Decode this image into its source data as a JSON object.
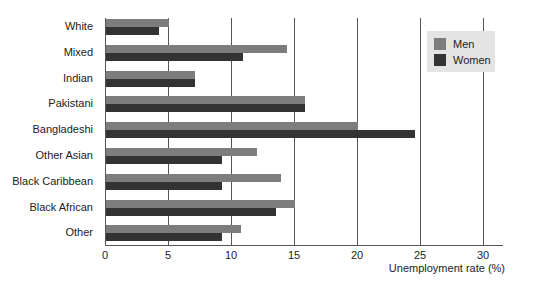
{
  "chart_data": {
    "type": "bar",
    "orientation": "horizontal",
    "title": "",
    "xlabel": "Unemployment rate (%)",
    "ylabel": "",
    "xlim": [
      0,
      30
    ],
    "xticks": [
      0,
      5,
      10,
      15,
      20,
      25,
      30
    ],
    "grid": true,
    "legend_position": "upper right",
    "categories": [
      "White",
      "Mixed",
      "Indian",
      "Pakistani",
      "Bangladeshi",
      "Other Asian",
      "Black Caribbean",
      "Black African",
      "Other"
    ],
    "series": [
      {
        "name": "Men",
        "color": "#7d7d7d",
        "values": [
          5.0,
          14.4,
          7.1,
          15.8,
          20.0,
          12.0,
          13.9,
          15.0,
          10.7
        ]
      },
      {
        "name": "Women",
        "color": "#333333",
        "values": [
          4.2,
          10.9,
          7.1,
          15.8,
          24.5,
          9.2,
          9.2,
          13.5,
          9.2
        ]
      }
    ]
  },
  "legend": {
    "men": "Men",
    "women": "Women"
  },
  "labels": {
    "categories": [
      "White",
      "Mixed",
      "Indian",
      "Pakistani",
      "Bangladeshi",
      "Other Asian",
      "Black Caribbean",
      "Black African",
      "Other"
    ],
    "ticks": [
      "0",
      "5",
      "10",
      "15",
      "20",
      "25",
      "30"
    ],
    "xlabel": "Unemployment rate (%)"
  }
}
